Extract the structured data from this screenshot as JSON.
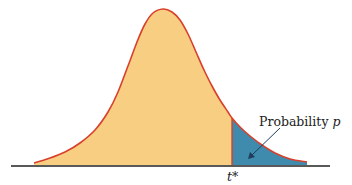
{
  "chart_data": {
    "type": "area",
    "title": "",
    "xlabel": "",
    "ylabel": "",
    "grid": false,
    "legend": null,
    "critical_value_label": "t*",
    "tail_label": "Probability p",
    "tail_label_prefix": "Probability ",
    "tail_label_var": "p",
    "colors": {
      "body_fill": "#F8CF82",
      "tail_fill": "#3E8BAE",
      "curve_stroke": "#D9402B",
      "axis": "#222222",
      "arrow": "#1F3D5A"
    },
    "curve_points_px": [
      [
        34,
        163
      ],
      [
        50,
        158
      ],
      [
        65,
        152
      ],
      [
        80,
        143
      ],
      [
        95,
        130
      ],
      [
        108,
        112
      ],
      [
        118,
        92
      ],
      [
        128,
        66
      ],
      [
        137,
        42
      ],
      [
        145,
        24
      ],
      [
        153,
        13
      ],
      [
        163,
        9
      ],
      [
        172,
        12
      ],
      [
        180,
        20
      ],
      [
        188,
        34
      ],
      [
        196,
        52
      ],
      [
        204,
        70
      ],
      [
        212,
        86
      ],
      [
        220,
        100
      ],
      [
        228,
        112
      ],
      [
        232,
        118
      ],
      [
        240,
        127
      ],
      [
        250,
        136
      ],
      [
        262,
        145
      ],
      [
        275,
        153
      ],
      [
        290,
        159
      ],
      [
        307,
        162
      ]
    ],
    "t_star_x_px": 232,
    "axis_y_px": 166
  }
}
